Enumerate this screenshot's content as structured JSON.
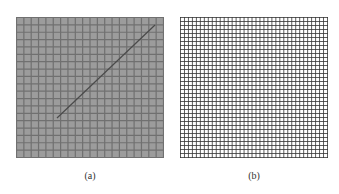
{
  "figure": {
    "panels": [
      {
        "id": "a",
        "caption": "(a)",
        "description": "Gray textured grid mesh with a diagonal line",
        "fill_color": "#9c9c9c",
        "grid_color": "#707070",
        "grid_cells_x": 20,
        "grid_cells_y": 19,
        "diagonal": {
          "x1": 41,
          "y1": 101,
          "x2": 139,
          "y2": 8,
          "color": "#4a4a4a"
        }
      },
      {
        "id": "b",
        "caption": "(b)",
        "description": "Fine black square grid on white",
        "fill_color": "#ffffff",
        "grid_color": "#333333",
        "grid_cells_x": 37,
        "grid_cells_y": 35
      }
    ]
  }
}
